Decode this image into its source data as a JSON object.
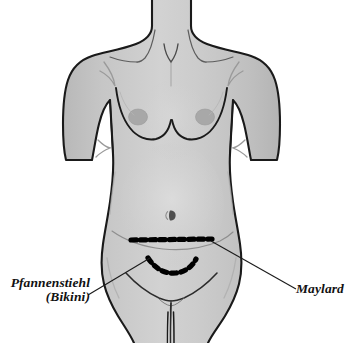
{
  "figure": {
    "kind": "anatomical-illustration",
    "background_color": "#ffffff",
    "body_fill_color": "#c5c5c5",
    "body_shadow_color": "#b0b0b0",
    "body_highlight_color": "#d8d8d8",
    "outline_color": "#1a1a1a",
    "areola_color": "#a9a9a9",
    "navel_color": "#5a5a5a",
    "incision_color": "#000000",
    "leader_line_color": "#1a1a1a"
  },
  "labels": {
    "pfannenstiehl": {
      "line1": "Pfannenstiehl",
      "line2": "(Bikini)"
    },
    "maylard": {
      "line1": "Maylard"
    }
  },
  "incisions": [
    {
      "name": "maylard-incision",
      "style": "dashed-straight-transverse",
      "dash_count": 10,
      "label_ref": "maylard"
    },
    {
      "name": "pfannenstiel-incision",
      "style": "dashed-curved-transverse",
      "dash_count": 8,
      "label_ref": "pfannenstiehl"
    }
  ],
  "anatomy_features": [
    {
      "name": "neck",
      "visible": true
    },
    {
      "name": "suprasternal-notch",
      "visible": true
    },
    {
      "name": "sternocleidomastoid-lines",
      "visible": true
    },
    {
      "name": "clavicle-lines",
      "visible": true
    },
    {
      "name": "shoulder-deltoid-left",
      "visible": true
    },
    {
      "name": "shoulder-deltoid-right",
      "visible": true
    },
    {
      "name": "upper-arm-left",
      "visible": true
    },
    {
      "name": "upper-arm-right",
      "visible": true
    },
    {
      "name": "breast-left",
      "visible": true
    },
    {
      "name": "breast-right",
      "visible": true
    },
    {
      "name": "areola-left",
      "visible": true
    },
    {
      "name": "areola-right",
      "visible": true
    },
    {
      "name": "navel",
      "visible": true
    },
    {
      "name": "waist",
      "visible": true
    },
    {
      "name": "iliac-crest-hip",
      "visible": true
    },
    {
      "name": "lower-abdominal-crease",
      "visible": true
    },
    {
      "name": "inguinal-crease-left",
      "visible": true
    },
    {
      "name": "inguinal-crease-right",
      "visible": true
    },
    {
      "name": "perineal-line",
      "visible": true
    },
    {
      "name": "thigh-left",
      "visible": true
    },
    {
      "name": "thigh-right",
      "visible": true
    }
  ]
}
